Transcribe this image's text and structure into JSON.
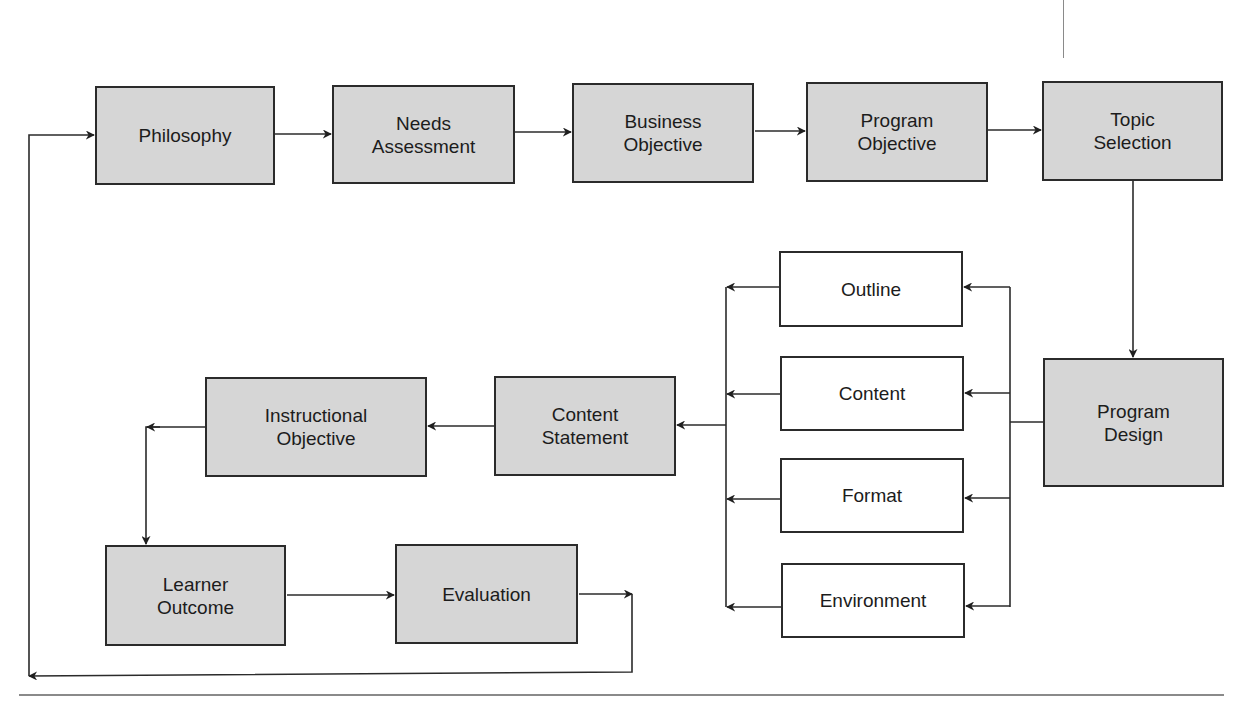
{
  "diagram": {
    "colors": {
      "shaded_fill": "#d6d6d6",
      "plain_fill": "#ffffff",
      "stroke": "#2b2b2b",
      "rule": "#8a8a8a"
    },
    "nodes": [
      {
        "id": "philosophy",
        "label": "Philosophy",
        "style": "shaded",
        "x": 95,
        "y": 86,
        "w": 180,
        "h": 99
      },
      {
        "id": "needs-assessment",
        "label": "Needs\nAssessment",
        "style": "shaded",
        "x": 332,
        "y": 85,
        "w": 183,
        "h": 99
      },
      {
        "id": "business-objective",
        "label": "Business\nObjective",
        "style": "shaded",
        "x": 572,
        "y": 83,
        "w": 182,
        "h": 100
      },
      {
        "id": "program-objective",
        "label": "Program\nObjective",
        "style": "shaded",
        "x": 806,
        "y": 82,
        "w": 182,
        "h": 100
      },
      {
        "id": "topic-selection",
        "label": "Topic\nSelection",
        "style": "shaded",
        "x": 1042,
        "y": 81,
        "w": 181,
        "h": 100
      },
      {
        "id": "program-design",
        "label": "Program\nDesign",
        "style": "shaded",
        "x": 1043,
        "y": 358,
        "w": 181,
        "h": 129
      },
      {
        "id": "outline",
        "label": "Outline",
        "style": "plain",
        "x": 779,
        "y": 251,
        "w": 184,
        "h": 76
      },
      {
        "id": "content",
        "label": "Content",
        "style": "plain",
        "x": 780,
        "y": 356,
        "w": 184,
        "h": 75
      },
      {
        "id": "format",
        "label": "Format",
        "style": "plain",
        "x": 780,
        "y": 458,
        "w": 184,
        "h": 75
      },
      {
        "id": "environment",
        "label": "Environment",
        "style": "plain",
        "x": 781,
        "y": 563,
        "w": 184,
        "h": 75
      },
      {
        "id": "content-statement",
        "label": "Content\nStatement",
        "style": "shaded",
        "x": 494,
        "y": 376,
        "w": 182,
        "h": 100
      },
      {
        "id": "instructional-objective",
        "label": "Instructional\nObjective",
        "style": "shaded",
        "x": 205,
        "y": 377,
        "w": 222,
        "h": 100
      },
      {
        "id": "learner-outcome",
        "label": "Learner\nOutcome",
        "style": "shaded",
        "x": 105,
        "y": 545,
        "w": 181,
        "h": 101
      },
      {
        "id": "evaluation",
        "label": "Evaluation",
        "style": "shaded",
        "x": 395,
        "y": 544,
        "w": 183,
        "h": 100
      }
    ],
    "connectors": [
      {
        "name": "philosophy-to-needs",
        "points": [
          [
            275,
            134
          ],
          [
            331,
            134
          ]
        ],
        "arrow": true
      },
      {
        "name": "needs-to-business",
        "points": [
          [
            515,
            132
          ],
          [
            571,
            132
          ]
        ],
        "arrow": true
      },
      {
        "name": "business-to-program-objective",
        "points": [
          [
            755,
            131
          ],
          [
            805,
            131
          ]
        ],
        "arrow": true
      },
      {
        "name": "program-objective-to-topic",
        "points": [
          [
            988,
            130
          ],
          [
            1041,
            130
          ]
        ],
        "arrow": true
      },
      {
        "name": "topic-to-program-design",
        "points": [
          [
            1133,
            181
          ],
          [
            1133,
            357
          ]
        ],
        "arrow": true
      },
      {
        "name": "program-design-stub",
        "points": [
          [
            1043,
            422
          ],
          [
            1010,
            422
          ]
        ],
        "arrow": false
      },
      {
        "name": "right-bus",
        "points": [
          [
            1010,
            287
          ],
          [
            1010,
            607
          ]
        ],
        "arrow": false
      },
      {
        "name": "bus-to-outline",
        "points": [
          [
            1010,
            287
          ],
          [
            964,
            287
          ]
        ],
        "arrow": true
      },
      {
        "name": "bus-to-content",
        "points": [
          [
            1010,
            393
          ],
          [
            965,
            393
          ]
        ],
        "arrow": true
      },
      {
        "name": "bus-to-format",
        "points": [
          [
            1010,
            498
          ],
          [
            965,
            498
          ]
        ],
        "arrow": true
      },
      {
        "name": "bus-to-environment",
        "points": [
          [
            1010,
            606
          ],
          [
            966,
            606
          ]
        ],
        "arrow": true
      },
      {
        "name": "left-bus",
        "points": [
          [
            726,
            287
          ],
          [
            726,
            607
          ]
        ],
        "arrow": false
      },
      {
        "name": "outline-to-left-bus",
        "points": [
          [
            779,
            287
          ],
          [
            727,
            287
          ]
        ],
        "arrow": true
      },
      {
        "name": "content-to-left-bus",
        "points": [
          [
            780,
            394
          ],
          [
            727,
            394
          ]
        ],
        "arrow": true
      },
      {
        "name": "format-to-left-bus",
        "points": [
          [
            780,
            499
          ],
          [
            727,
            499
          ]
        ],
        "arrow": true
      },
      {
        "name": "environment-to-left-bus",
        "points": [
          [
            781,
            607
          ],
          [
            727,
            607
          ]
        ],
        "arrow": true
      },
      {
        "name": "left-bus-to-content-statement",
        "points": [
          [
            726,
            425
          ],
          [
            677,
            425
          ]
        ],
        "arrow": true
      },
      {
        "name": "content-statement-to-instructional",
        "points": [
          [
            494,
            426
          ],
          [
            428,
            426
          ]
        ],
        "arrow": true
      },
      {
        "name": "instructional-to-learner-outcome",
        "points": [
          [
            205,
            427
          ],
          [
            146,
            427
          ],
          [
            146,
            544
          ]
        ],
        "arrow": true
      },
      {
        "name": "instructional-arrow-marker",
        "points": [
          [
            160,
            427
          ],
          [
            147,
            427
          ]
        ],
        "arrow": true
      },
      {
        "name": "learner-to-evaluation",
        "points": [
          [
            287,
            595
          ],
          [
            394,
            595
          ]
        ],
        "arrow": true
      },
      {
        "name": "evaluation-to-return",
        "points": [
          [
            579,
            594
          ],
          [
            632,
            594
          ]
        ],
        "arrow": true
      },
      {
        "name": "return-loop",
        "points": [
          [
            632,
            594
          ],
          [
            632,
            672
          ],
          [
            29,
            676
          ]
        ],
        "arrow": true
      },
      {
        "name": "loop-up-to-philosophy",
        "points": [
          [
            29,
            676
          ],
          [
            29,
            135
          ],
          [
            94,
            135
          ]
        ],
        "arrow": true
      }
    ],
    "rules": [
      {
        "name": "top-page-mark",
        "x": 1063,
        "y": 0,
        "w": 1,
        "h": 58
      },
      {
        "name": "bottom-page-rule",
        "x": 19,
        "y": 694,
        "w": 1205,
        "h": 2
      }
    ]
  }
}
